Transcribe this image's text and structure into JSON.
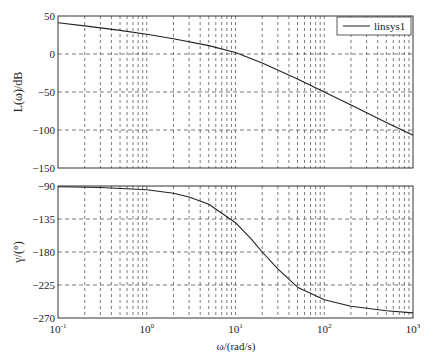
{
  "chart_data": [
    {
      "type": "line",
      "title": "",
      "xlabel": "",
      "ylabel": "L(ω)/dB",
      "xscale": "log",
      "xlim": [
        0.1,
        1000
      ],
      "ylim": [
        -150,
        50
      ],
      "yticks": [
        50,
        0,
        -50,
        -100,
        -150
      ],
      "ytick_labels": [
        "50",
        "0",
        "−50",
        "−100",
        "−150"
      ],
      "grid": true,
      "legend_position": "upper right",
      "series": [
        {
          "name": "linsys1",
          "x": [
            0.1,
            0.2,
            0.5,
            1,
            2,
            5,
            10,
            20,
            50,
            100,
            200,
            500,
            1000
          ],
          "values": [
            41,
            37,
            31,
            26,
            20,
            11,
            2,
            -12,
            -33,
            -50,
            -67,
            -90,
            -107
          ]
        }
      ]
    },
    {
      "type": "line",
      "title": "",
      "xlabel": "ω/(rad/s)",
      "ylabel": "γ/(°)",
      "xscale": "log",
      "xlim": [
        0.1,
        1000
      ],
      "ylim": [
        -270,
        -90
      ],
      "yticks": [
        -90,
        -135,
        -180,
        -225,
        -270
      ],
      "ytick_labels": [
        "−90",
        "−135",
        "−180",
        "−225",
        "−270"
      ],
      "xticks": [
        0.1,
        1,
        10,
        100,
        1000
      ],
      "xtick_labels": [
        [
          "10",
          "-1"
        ],
        [
          "10",
          "0"
        ],
        [
          "10",
          "1"
        ],
        [
          "10",
          "2"
        ],
        [
          "10",
          "3"
        ]
      ],
      "grid": true,
      "series": [
        {
          "name": "linsys1",
          "x": [
            0.1,
            0.3,
            1,
            2,
            3,
            5,
            8,
            10,
            15,
            20,
            30,
            50,
            100,
            200,
            500,
            1000
          ],
          "values": [
            -91,
            -92,
            -95,
            -100,
            -105,
            -115,
            -132,
            -140,
            -162,
            -180,
            -203,
            -228,
            -245,
            -254,
            -260,
            -263
          ]
        }
      ]
    }
  ],
  "legend": {
    "label": "linsys1"
  },
  "axes": {
    "top_ylabel": "L(ω)/dB",
    "bottom_ylabel": "γ/(°)",
    "xlabel": "ω/(rad/s)"
  }
}
